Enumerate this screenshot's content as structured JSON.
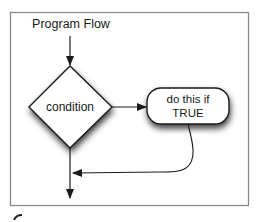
{
  "diagram": {
    "title": "Program Flow",
    "nodes": [
      {
        "id": "condition",
        "shape": "diamond",
        "label": "condition"
      },
      {
        "id": "action",
        "shape": "rounded-rect",
        "label_line1": "do this if",
        "label_line2": "TRUE"
      }
    ],
    "edges": [
      {
        "from": "start",
        "to": "condition"
      },
      {
        "from": "condition",
        "to": "action"
      },
      {
        "from": "action",
        "to": "main-flow"
      },
      {
        "from": "condition",
        "to": "exit"
      }
    ],
    "colors": {
      "frame": "#8a8a8a",
      "stroke": "#222222",
      "shadow": "#555555",
      "fill": "#ffffff"
    }
  }
}
